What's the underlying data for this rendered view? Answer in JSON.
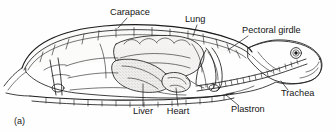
{
  "figure": {
    "panel_label": "(a)",
    "caption_absent": true,
    "style": "black and white line drawing with stipple shading",
    "background_color": "#fefefe",
    "ink_color": "#1d1d1d",
    "text_color": "#141414",
    "orientation": "head at right, tail at left"
  },
  "labels": [
    {
      "id": "carapace",
      "text": "Carapace",
      "text_x": 110,
      "text_y": 15,
      "anchor": "start",
      "leader": "M 127 18 L 118 28",
      "points_to": "upper shell / dorsal bony plate"
    },
    {
      "id": "lung",
      "text": "Lung",
      "text_x": 185,
      "text_y": 22,
      "anchor": "start",
      "leader": "M 197 25 L 193 36",
      "points_to": "lung cavity beneath carapace"
    },
    {
      "id": "pectoral-girdle",
      "text": "Pectoral girdle",
      "text_x": 242,
      "text_y": 33,
      "anchor": "start",
      "leader": "M 248 36 L 228 50",
      "points_to": "shoulder girdle bones"
    },
    {
      "id": "trachea",
      "text": "Trachea",
      "text_x": 281,
      "text_y": 96,
      "anchor": "start",
      "leader": "M 288 90 L 281 81",
      "points_to": "segmented windpipe tube"
    },
    {
      "id": "plastron",
      "text": "Plastron",
      "text_x": 231,
      "text_y": 112,
      "anchor": "start",
      "leader": "M 238 105 L 226 95",
      "points_to": "lower shell / ventral bony plate"
    },
    {
      "id": "heart",
      "text": "Heart",
      "text_x": 178,
      "text_y": 114,
      "anchor": "middle",
      "leader": "M 178 106 L 176 88",
      "points_to": "heart chamber"
    },
    {
      "id": "liver",
      "text": "Liver",
      "text_x": 143,
      "text_y": 114,
      "anchor": "middle",
      "leader": "M 143 106 L 143 84",
      "points_to": "liver lobe"
    }
  ]
}
